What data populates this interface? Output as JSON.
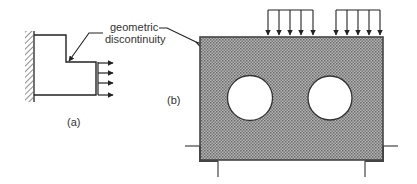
{
  "figure": {
    "annotation": {
      "line1": "geometric",
      "line2": "discontinuity"
    },
    "panel_a": {
      "label": "(a)"
    },
    "panel_b": {
      "label": "(b)"
    }
  },
  "colors": {
    "stroke": "#222222",
    "plate_fill": "#9a9a9a",
    "hole_fill": "#ffffff",
    "text": "#333333"
  }
}
